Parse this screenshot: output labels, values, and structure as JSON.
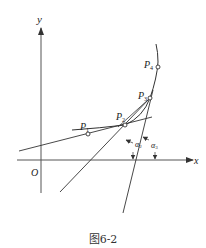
{
  "figure": {
    "caption": "图6-2",
    "axes": {
      "x_label": "x",
      "y_label": "y",
      "origin_label": "O"
    },
    "points": [
      {
        "name": "P1",
        "base": "P",
        "sub": "1"
      },
      {
        "name": "P2",
        "base": "P",
        "sub": "2"
      },
      {
        "name": "P3",
        "base": "P",
        "sub": "3"
      },
      {
        "name": "P4",
        "base": "P",
        "sub": "4"
      }
    ],
    "angles": [
      {
        "name": "alpha2",
        "base": "α",
        "sub": "2"
      },
      {
        "name": "alpha3",
        "base": "α",
        "sub": "3"
      }
    ],
    "colors": {
      "stroke": "#333333",
      "background": "#ffffff"
    }
  }
}
